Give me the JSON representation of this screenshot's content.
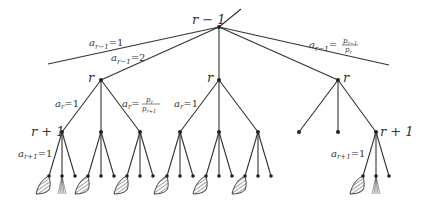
{
  "diagram": {
    "type": "tree",
    "root": {
      "label": "r − 1",
      "x": 219,
      "y": 27
    },
    "root_stub": {
      "x2": 241,
      "y2": 9
    },
    "top_edges": [
      {
        "to": "left-trunc",
        "x2": 48,
        "y2": 64,
        "label_base": "a",
        "label_sub": "r−1",
        "label_rhs": "=1"
      },
      {
        "to": "r-left",
        "label_base": "a",
        "label_sub": "r−1",
        "label_rhs": "=2"
      },
      {
        "to": "r-middle"
      },
      {
        "to": "r-right"
      },
      {
        "to": "right-trunc",
        "x2": 389,
        "y2": 65,
        "label_base": "a",
        "label_sub": "r−1",
        "label_rhs_num": "p",
        "label_rhs_num_sub": "r−1",
        "label_rhs_den": "p",
        "label_rhs_den_sub": "r"
      }
    ],
    "r_nodes": [
      {
        "id": "r-left",
        "label": "r",
        "x": 101,
        "y": 80
      },
      {
        "id": "r-middle",
        "label": "r",
        "x": 219,
        "y": 80
      },
      {
        "id": "r-right",
        "label": "r",
        "x": 338,
        "y": 80
      }
    ],
    "edge_labels": {
      "ar_eq_1": {
        "base": "a",
        "sub": "r",
        "rhs": "=1"
      },
      "ar_frac": {
        "base": "a",
        "sub": "r",
        "num": "p",
        "num_sub": "r",
        "den": "p",
        "den_sub": "r+1"
      },
      "ar1_eq_1": {
        "base": "a",
        "sub": "r+1",
        "rhs": "=1"
      }
    },
    "r_plus_1_label": "r + 1",
    "labels": {
      "root": "r − 1",
      "r": "r",
      "r_plus_1": "r + 1"
    }
  }
}
